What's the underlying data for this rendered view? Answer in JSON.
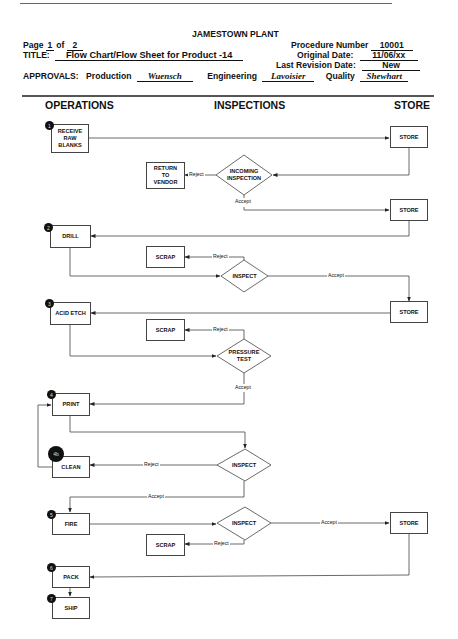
{
  "header": {
    "plant": "JAMESTOWN PLANT",
    "page_label": "Page",
    "page_current": "1",
    "page_of_label": "of",
    "page_total": "2",
    "title_label": "TITLE:",
    "title_value": "Flow Chart/Flow Sheet for Product -14",
    "procedure_label": "Procedure Number",
    "procedure_value": "10001",
    "original_date_label": "Original Date:",
    "original_date_value": "11/06/xx",
    "revision_label": "Last Revision Date:",
    "revision_value": "New",
    "approvals_label": "APPROVALS:",
    "production_label": "Production",
    "production_sig": "Wuensch",
    "engineering_label": "Engineering",
    "engineering_sig": "Lavoisier",
    "quality_label": "Quality",
    "quality_sig": "Shewhart"
  },
  "columns": {
    "operations": "OPERATIONS",
    "inspections": "INSPECTIONS",
    "store": "STORE"
  },
  "steps": {
    "receive": {
      "badge": "1",
      "label": "RECEIVE\nRAW\nBLANKS"
    },
    "drill": {
      "badge": "2",
      "label": "DRILL"
    },
    "acid_etch": {
      "badge": "3",
      "label": "ACID ETCH"
    },
    "print": {
      "badge": "4",
      "label": "PRINT"
    },
    "clean": {
      "badge": "4b",
      "label": "CLEAN"
    },
    "fire": {
      "badge": "5",
      "label": "FIRE"
    },
    "pack": {
      "badge": "6",
      "label": "PACK"
    },
    "ship": {
      "badge": "7",
      "label": "SHIP"
    }
  },
  "stores": [
    "STORE",
    "STORE",
    "STORE",
    "STORE"
  ],
  "inspections": {
    "incoming": "INCOMING\nINSPECTION",
    "inspect1": "INSPECT",
    "pressure": "PRESSURE\nTEST",
    "inspect2": "INSPECT",
    "inspect3": "INSPECT"
  },
  "dispositions": {
    "return_vendor": "RETURN\nTO\nVENDOR",
    "scrap1": "SCRAP",
    "scrap2": "SCRAP",
    "scrap3": "SCRAP"
  },
  "edge_labels": {
    "reject": "Reject",
    "accept": "Accept"
  }
}
